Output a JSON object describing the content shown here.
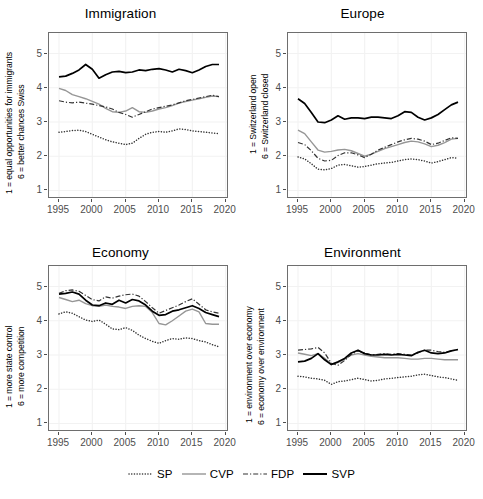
{
  "figure": {
    "width": 483,
    "height": 499,
    "background": "#ffffff",
    "axis_color": "#4d4d4d",
    "grid_color": "#f2f2f2",
    "panel_border": "#6e6e6e"
  },
  "legend": {
    "position": "bottom",
    "entries": [
      {
        "label": "SP",
        "style": "dotted",
        "color": "#333333"
      },
      {
        "label": "CVP",
        "style": "solid",
        "color": "#969696"
      },
      {
        "label": "FDP",
        "style": "dashdot",
        "color": "#333333"
      },
      {
        "label": "SVP",
        "style": "solid",
        "color": "#000000"
      }
    ]
  },
  "chart_data": [
    {
      "type": "line",
      "title": "Immigration",
      "xlabel": "",
      "ylabel": "1 = equal opportunities for immigrants\n6 = better chances Swiss",
      "ylabel_line1": "1 = equal opportunities for immigrants",
      "ylabel_line2": "6 = better chances Swiss",
      "xlim": [
        1993.5,
        2020.5
      ],
      "ylim": [
        0.75,
        5.6
      ],
      "xticks": [
        1995,
        2000,
        2005,
        2010,
        2015,
        2020
      ],
      "yticks": [
        1,
        2,
        3,
        4,
        5
      ],
      "grid": true,
      "x": [
        1995,
        1996,
        1997,
        1998,
        1999,
        2000,
        2001,
        2002,
        2003,
        2004,
        2005,
        2006,
        2007,
        2008,
        2009,
        2010,
        2011,
        2012,
        2013,
        2014,
        2015,
        2016,
        2017,
        2018,
        2019
      ],
      "series": [
        {
          "name": "SP",
          "values": [
            2.7,
            2.72,
            2.75,
            2.76,
            2.72,
            2.64,
            2.56,
            2.48,
            2.42,
            2.38,
            2.34,
            2.38,
            2.52,
            2.64,
            2.7,
            2.72,
            2.7,
            2.74,
            2.8,
            2.78,
            2.74,
            2.72,
            2.7,
            2.68,
            2.66
          ]
        },
        {
          "name": "CVP",
          "values": [
            3.98,
            3.92,
            3.8,
            3.74,
            3.68,
            3.6,
            3.52,
            3.4,
            3.3,
            3.28,
            3.32,
            3.42,
            3.3,
            3.28,
            3.32,
            3.38,
            3.42,
            3.48,
            3.55,
            3.6,
            3.64,
            3.68,
            3.72,
            3.76,
            3.74
          ]
        },
        {
          "name": "FDP",
          "values": [
            3.62,
            3.58,
            3.56,
            3.58,
            3.55,
            3.52,
            3.48,
            3.44,
            3.38,
            3.28,
            3.22,
            3.14,
            3.22,
            3.3,
            3.38,
            3.42,
            3.46,
            3.5,
            3.56,
            3.62,
            3.66,
            3.7,
            3.74,
            3.78,
            3.74
          ]
        },
        {
          "name": "SVP",
          "values": [
            4.32,
            4.34,
            4.42,
            4.52,
            4.68,
            4.54,
            4.28,
            4.38,
            4.46,
            4.48,
            4.44,
            4.46,
            4.52,
            4.5,
            4.54,
            4.56,
            4.52,
            4.46,
            4.54,
            4.5,
            4.44,
            4.52,
            4.62,
            4.68,
            4.68
          ]
        }
      ]
    },
    {
      "type": "line",
      "title": "Europe",
      "xlabel": "",
      "ylabel": "1 = Switzerland open\n6 = Switzerland closed",
      "ylabel_line1": "1 = Switzerland open",
      "ylabel_line2": "6 = Switzerland closed",
      "xlim": [
        1993.5,
        2020.5
      ],
      "ylim": [
        0.75,
        5.6
      ],
      "xticks": [
        1995,
        2000,
        2005,
        2010,
        2015,
        2020
      ],
      "yticks": [
        1,
        2,
        3,
        4,
        5
      ],
      "grid": true,
      "x": [
        1995,
        1996,
        1997,
        1998,
        1999,
        2000,
        2001,
        2002,
        2003,
        2004,
        2005,
        2006,
        2007,
        2008,
        2009,
        2010,
        2011,
        2012,
        2013,
        2014,
        2015,
        2016,
        2017,
        2018,
        2019
      ],
      "series": [
        {
          "name": "SP",
          "values": [
            1.98,
            1.92,
            1.78,
            1.62,
            1.6,
            1.64,
            1.74,
            1.76,
            1.72,
            1.68,
            1.7,
            1.74,
            1.78,
            1.8,
            1.82,
            1.86,
            1.9,
            1.92,
            1.9,
            1.86,
            1.8,
            1.84,
            1.9,
            1.96,
            1.94
          ]
        },
        {
          "name": "CVP",
          "values": [
            2.76,
            2.66,
            2.42,
            2.18,
            2.12,
            2.14,
            2.18,
            2.2,
            2.16,
            2.08,
            2.0,
            2.06,
            2.14,
            2.22,
            2.28,
            2.34,
            2.4,
            2.44,
            2.42,
            2.36,
            2.28,
            2.32,
            2.4,
            2.5,
            2.52
          ]
        },
        {
          "name": "FDP",
          "values": [
            2.4,
            2.34,
            2.16,
            1.94,
            1.86,
            1.88,
            2.02,
            2.1,
            2.1,
            2.04,
            1.96,
            2.06,
            2.18,
            2.26,
            2.34,
            2.42,
            2.48,
            2.52,
            2.5,
            2.44,
            2.34,
            2.38,
            2.46,
            2.54,
            2.52
          ]
        },
        {
          "name": "SVP",
          "values": [
            3.68,
            3.54,
            3.28,
            3.0,
            2.98,
            3.06,
            3.18,
            3.08,
            3.12,
            3.12,
            3.1,
            3.14,
            3.14,
            3.12,
            3.1,
            3.18,
            3.3,
            3.28,
            3.14,
            3.06,
            3.12,
            3.22,
            3.36,
            3.5,
            3.58
          ]
        }
      ]
    },
    {
      "type": "line",
      "title": "Economy",
      "xlabel": "",
      "ylabel": "1 = more state control\n6 = more competition",
      "ylabel_line1": "1 = more state control",
      "ylabel_line2": "6 = more competition",
      "xlim": [
        1993.5,
        2020.5
      ],
      "ylim": [
        0.75,
        5.6
      ],
      "xticks": [
        1995,
        2000,
        2005,
        2010,
        2015,
        2020
      ],
      "yticks": [
        1,
        2,
        3,
        4,
        5
      ],
      "grid": true,
      "x": [
        1995,
        1996,
        1997,
        1998,
        1999,
        2000,
        2001,
        2002,
        2003,
        2004,
        2005,
        2006,
        2007,
        2008,
        2009,
        2010,
        2011,
        2012,
        2013,
        2014,
        2015,
        2016,
        2017,
        2018,
        2019
      ],
      "series": [
        {
          "name": "SP",
          "values": [
            4.2,
            4.26,
            4.22,
            4.12,
            4.02,
            3.98,
            4.02,
            3.9,
            3.76,
            3.74,
            3.8,
            3.72,
            3.58,
            3.48,
            3.4,
            3.34,
            3.42,
            3.48,
            3.46,
            3.5,
            3.48,
            3.42,
            3.38,
            3.3,
            3.24
          ]
        },
        {
          "name": "CVP",
          "values": [
            4.68,
            4.62,
            4.56,
            4.6,
            4.5,
            4.44,
            4.42,
            4.46,
            4.42,
            4.4,
            4.36,
            4.42,
            4.44,
            4.42,
            4.24,
            3.92,
            3.88,
            4.0,
            4.14,
            4.28,
            4.34,
            4.26,
            3.92,
            3.9,
            3.9
          ]
        },
        {
          "name": "FDP",
          "values": [
            4.8,
            4.88,
            4.9,
            4.86,
            4.74,
            4.62,
            4.58,
            4.7,
            4.66,
            4.72,
            4.76,
            4.78,
            4.72,
            4.56,
            4.38,
            4.22,
            4.3,
            4.38,
            4.46,
            4.56,
            4.64,
            4.48,
            4.32,
            4.26,
            4.22
          ]
        },
        {
          "name": "SVP",
          "values": [
            4.78,
            4.8,
            4.84,
            4.78,
            4.6,
            4.46,
            4.44,
            4.52,
            4.48,
            4.6,
            4.52,
            4.62,
            4.58,
            4.46,
            4.28,
            4.16,
            4.18,
            4.28,
            4.32,
            4.38,
            4.44,
            4.36,
            4.24,
            4.18,
            4.12
          ]
        }
      ]
    },
    {
      "type": "line",
      "title": "Environment",
      "xlabel": "",
      "ylabel": "1 = environment over economy\n6 = economy over environment",
      "ylabel_line1": "1 = environment over economy",
      "ylabel_line2": "6 = economy over environment",
      "xlim": [
        1993.5,
        2020.5
      ],
      "ylim": [
        0.75,
        5.6
      ],
      "xticks": [
        1995,
        2000,
        2005,
        2010,
        2015,
        2020
      ],
      "yticks": [
        1,
        2,
        3,
        4,
        5
      ],
      "grid": true,
      "x": [
        1995,
        1996,
        1997,
        1998,
        1999,
        2000,
        2001,
        2002,
        2003,
        2004,
        2005,
        2006,
        2007,
        2008,
        2009,
        2010,
        2011,
        2012,
        2013,
        2014,
        2015,
        2016,
        2017,
        2018,
        2019
      ],
      "series": [
        {
          "name": "SP",
          "values": [
            2.38,
            2.36,
            2.32,
            2.3,
            2.26,
            2.14,
            2.22,
            2.24,
            2.28,
            2.32,
            2.28,
            2.24,
            2.26,
            2.3,
            2.32,
            2.34,
            2.36,
            2.38,
            2.42,
            2.44,
            2.4,
            2.36,
            2.34,
            2.3,
            2.26
          ]
        },
        {
          "name": "CVP",
          "values": [
            3.06,
            3.02,
            2.98,
            3.04,
            2.9,
            2.74,
            2.78,
            2.88,
            3.0,
            3.04,
            3.0,
            2.96,
            2.94,
            2.92,
            2.92,
            2.92,
            2.9,
            2.88,
            2.88,
            2.9,
            2.9,
            2.88,
            2.86,
            2.86,
            2.86
          ]
        },
        {
          "name": "FDP",
          "values": [
            3.14,
            3.16,
            3.18,
            3.22,
            3.06,
            2.76,
            2.7,
            2.84,
            3.02,
            3.12,
            3.06,
            3.0,
            3.02,
            3.04,
            3.02,
            3.04,
            3.02,
            3.0,
            3.06,
            3.14,
            3.14,
            3.1,
            3.08,
            3.12,
            3.16
          ]
        },
        {
          "name": "SVP",
          "values": [
            2.8,
            2.82,
            2.9,
            3.04,
            2.86,
            2.72,
            2.8,
            2.9,
            3.06,
            3.14,
            3.04,
            3.0,
            3.0,
            3.02,
            3.0,
            3.02,
            3.0,
            2.98,
            3.08,
            3.14,
            3.06,
            3.04,
            3.06,
            3.12,
            3.16
          ]
        }
      ]
    }
  ]
}
